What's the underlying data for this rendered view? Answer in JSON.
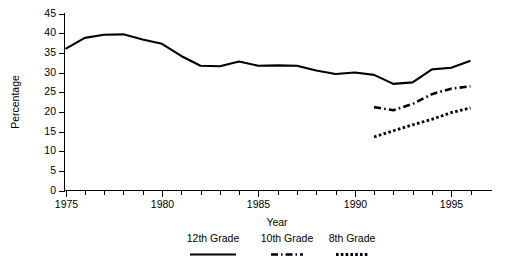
{
  "chart_data": {
    "type": "line",
    "title": "",
    "xlabel": "Year",
    "ylabel": "Percentage",
    "xlim": [
      1975,
      1996
    ],
    "ylim": [
      0,
      45
    ],
    "grid": false,
    "legend_position": "bottom",
    "x_ticks_major": [
      1975,
      1980,
      1985,
      1990,
      1995
    ],
    "x_tick_labels": [
      "1975",
      "1980",
      "1985",
      "1990",
      "1995"
    ],
    "y_ticks": [
      0,
      5,
      10,
      15,
      20,
      25,
      30,
      35,
      40,
      45
    ],
    "y_tick_labels": [
      "0",
      "5",
      "10",
      "15",
      "20",
      "25",
      "30",
      "35",
      "40",
      "45"
    ],
    "series": [
      {
        "name": "12th Grade",
        "style": "solid",
        "x": [
          1975,
          1976,
          1977,
          1978,
          1979,
          1980,
          1981,
          1982,
          1983,
          1984,
          1985,
          1986,
          1987,
          1988,
          1989,
          1990,
          1991,
          1992,
          1993,
          1994,
          1995,
          1996
        ],
        "values": [
          36.0,
          38.8,
          39.6,
          39.7,
          38.4,
          37.3,
          34.2,
          31.7,
          31.6,
          32.8,
          31.7,
          31.8,
          31.7,
          30.5,
          29.6,
          30.0,
          29.4,
          27.1,
          27.5,
          30.8,
          31.2,
          33.0
        ]
      },
      {
        "name": "10th Grade",
        "style": "dash-dot",
        "x": [
          1991,
          1992,
          1993,
          1994,
          1995,
          1996
        ],
        "values": [
          21.2,
          20.4,
          22.0,
          24.5,
          25.9,
          26.5
        ]
      },
      {
        "name": "8th Grade",
        "style": "dotted",
        "x": [
          1991,
          1992,
          1993,
          1994,
          1995,
          1996
        ],
        "values": [
          13.6,
          15.2,
          16.7,
          18.1,
          19.8,
          21.0
        ]
      }
    ]
  },
  "legend": {
    "items": [
      {
        "label": "12th Grade",
        "style": "solid"
      },
      {
        "label": "10th Grade",
        "style": "dash-dot"
      },
      {
        "label": "8th Grade",
        "style": "dotted"
      }
    ]
  },
  "colors": {
    "ink": "#000000",
    "background": "#ffffff"
  }
}
